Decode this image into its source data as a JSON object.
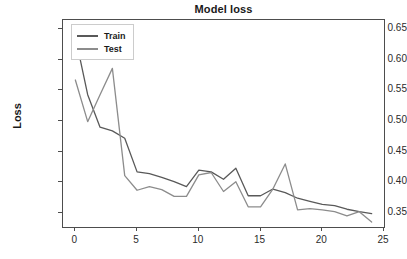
{
  "chart_data": {
    "type": "line",
    "title": "Model loss",
    "xlabel": "",
    "ylabel": "Loss",
    "xlim": [
      -1,
      25
    ],
    "ylim": [
      0.327,
      0.665
    ],
    "grid": false,
    "legend_position": "upper left",
    "xticks": [
      "0",
      "5",
      "10",
      "15",
      "20",
      "25"
    ],
    "xtick_values": [
      0,
      5,
      10,
      15,
      20,
      25
    ],
    "yticks": [
      "0.35",
      "0.40",
      "0.45",
      "0.50",
      "0.55",
      "0.60",
      "0.65"
    ],
    "ytick_values": [
      0.35,
      0.4,
      0.45,
      0.5,
      0.55,
      0.6,
      0.65
    ],
    "x": [
      0,
      1,
      2,
      3,
      4,
      5,
      6,
      7,
      8,
      9,
      10,
      11,
      12,
      13,
      14,
      15,
      16,
      17,
      18,
      19,
      20,
      21,
      22,
      23,
      24
    ],
    "series": [
      {
        "name": "Train",
        "color": "#595959",
        "values": [
          0.638,
          0.543,
          0.49,
          0.484,
          0.472,
          0.417,
          0.414,
          0.408,
          0.401,
          0.393,
          0.42,
          0.417,
          0.405,
          0.423,
          0.378,
          0.378,
          0.389,
          0.383,
          0.374,
          0.369,
          0.364,
          0.362,
          0.356,
          0.352,
          0.349
        ]
      },
      {
        "name": "Test",
        "color": "#8c8c8c",
        "values": [
          0.567,
          0.499,
          0.543,
          0.586,
          0.411,
          0.387,
          0.393,
          0.388,
          0.377,
          0.377,
          0.412,
          0.416,
          0.385,
          0.401,
          0.36,
          0.36,
          0.389,
          0.43,
          0.355,
          0.357,
          0.355,
          0.352,
          0.345,
          0.352,
          0.335
        ]
      }
    ]
  },
  "legend": {
    "items": [
      {
        "label": "Train"
      },
      {
        "label": "Test"
      }
    ]
  },
  "colors": {
    "train": "#595959",
    "test": "#8c8c8c",
    "axis": "#4d4d4d",
    "text": "#1a1a1a",
    "background": "#ffffff"
  }
}
